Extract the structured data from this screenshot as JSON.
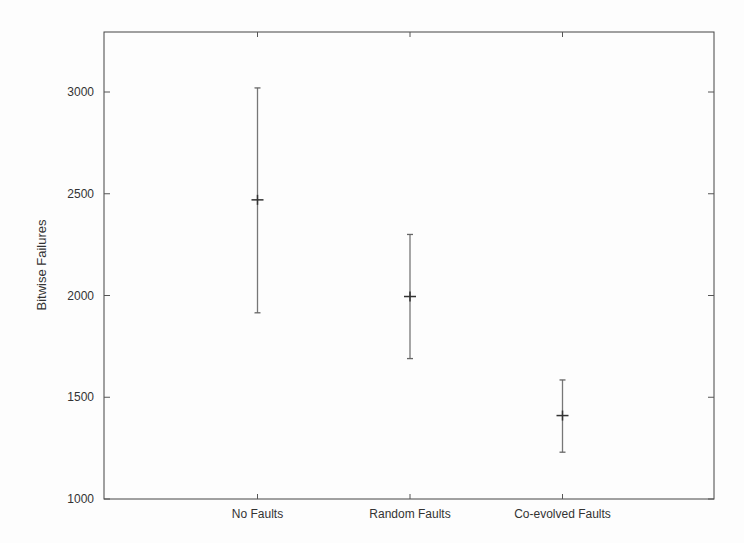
{
  "chart_data": {
    "type": "errorbar",
    "title": "",
    "xlabel": "",
    "ylabel": "Bitwise Failures",
    "ylim": [
      1000,
      3330
    ],
    "yticks": [
      1000,
      1500,
      2000,
      2500,
      3000
    ],
    "categories": [
      "No Faults",
      "Random Faults",
      "Co-evolved Faults"
    ],
    "series": [
      {
        "name": "Bitwise Failures",
        "values": [
          2470,
          1995,
          1410
        ],
        "lower": [
          1915,
          1690,
          1230
        ],
        "upper": [
          3020,
          2300,
          1585
        ]
      }
    ],
    "grid": false,
    "legend": null
  }
}
